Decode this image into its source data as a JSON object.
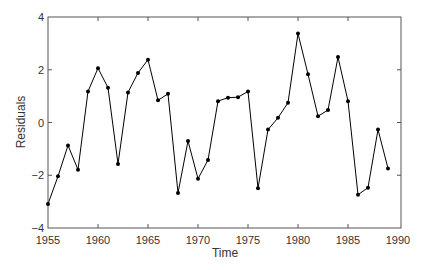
{
  "chart_data": {
    "type": "line",
    "title": "",
    "xlabel": "Time",
    "ylabel": "Residuals",
    "xlim": [
      1955,
      1990
    ],
    "ylim": [
      -4,
      4
    ],
    "xticks": [
      1955,
      1960,
      1965,
      1970,
      1975,
      1980,
      1985,
      1990
    ],
    "yticks": [
      -4,
      -2,
      0,
      2,
      4
    ],
    "grid": false,
    "legend": null,
    "marker": "circle",
    "series": [
      {
        "name": "Residuals",
        "color": "#000000",
        "x": [
          1955,
          1956,
          1957,
          1958,
          1959,
          1960,
          1961,
          1962,
          1963,
          1964,
          1965,
          1966,
          1967,
          1968,
          1969,
          1970,
          1971,
          1972,
          1973,
          1974,
          1975,
          1976,
          1977,
          1978,
          1979,
          1980,
          1981,
          1982,
          1983,
          1984,
          1985,
          1986,
          1987,
          1988,
          1989
        ],
        "values": [
          -3.09,
          -2.04,
          -0.87,
          -1.79,
          1.18,
          2.06,
          1.32,
          -1.57,
          1.14,
          1.88,
          2.38,
          0.84,
          1.09,
          -2.67,
          -0.7,
          -2.13,
          -1.42,
          0.81,
          0.94,
          0.96,
          1.18,
          -2.49,
          -0.27,
          0.18,
          0.75,
          3.37,
          1.83,
          0.24,
          0.47,
          2.48,
          0.81,
          -2.74,
          -2.47,
          -0.27,
          -1.74
        ]
      }
    ]
  },
  "style": {
    "axis_color": "#555555",
    "line_color": "#000000",
    "text_color": "#333333"
  }
}
